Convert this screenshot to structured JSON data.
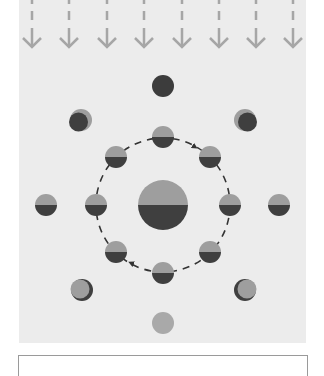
{
  "figure": {
    "type": "moon-phases-diagram",
    "colors": {
      "panel_background": "#ececec",
      "arrow": "#a6a6a6",
      "lit": "#9e9e9e",
      "dark": "#3f3f3f",
      "full_moon": "#a9a9a9",
      "new_moon": "#3c3c3c",
      "orbit": "#333333"
    },
    "sunlight_arrows": {
      "count": 8,
      "x_positions": [
        32,
        69,
        107,
        144,
        182,
        219,
        256,
        293
      ],
      "direction": "down"
    },
    "earth": {
      "cx": 163,
      "cy": 205,
      "r": 25,
      "label": "earth-half-lit"
    },
    "orbit": {
      "cx": 163,
      "cy": 205,
      "r": 67,
      "direction": "clockwise",
      "style": "dashed"
    },
    "inner_moons": [
      {
        "position": "top",
        "cx": 163,
        "cy": 137
      },
      {
        "position": "top-right",
        "cx": 210,
        "cy": 157
      },
      {
        "position": "right",
        "cx": 230,
        "cy": 205
      },
      {
        "position": "bottom-right",
        "cx": 210,
        "cy": 252
      },
      {
        "position": "bottom",
        "cx": 163,
        "cy": 273
      },
      {
        "position": "bottom-left",
        "cx": 116,
        "cy": 252
      },
      {
        "position": "left",
        "cx": 96,
        "cy": 205
      },
      {
        "position": "top-left",
        "cx": 116,
        "cy": 157
      }
    ],
    "outer_phases": [
      {
        "position": "top",
        "phase": "new-moon",
        "cx": 163,
        "cy": 86
      },
      {
        "position": "top-right",
        "phase": "waxing-crescent",
        "cx": 245,
        "cy": 120
      },
      {
        "position": "right",
        "phase": "first-quarter",
        "cx": 279,
        "cy": 205
      },
      {
        "position": "bottom-right",
        "phase": "waxing-gibbous",
        "cx": 245,
        "cy": 290
      },
      {
        "position": "bottom",
        "phase": "full-moon",
        "cx": 163,
        "cy": 323
      },
      {
        "position": "bottom-left",
        "phase": "waning-gibbous",
        "cx": 82,
        "cy": 290
      },
      {
        "position": "left",
        "phase": "third-quarter",
        "cx": 46,
        "cy": 205
      },
      {
        "position": "top-left",
        "phase": "waning-crescent",
        "cx": 81,
        "cy": 120
      }
    ]
  }
}
